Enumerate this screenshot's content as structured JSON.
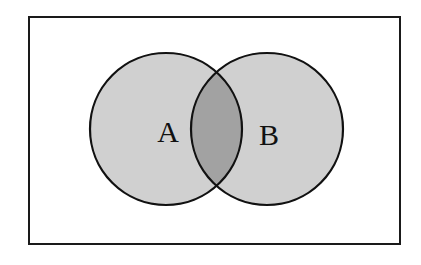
{
  "diagram": {
    "type": "venn",
    "universe": {
      "x": 29,
      "y": 17,
      "width": 371,
      "height": 227,
      "stroke": "#1a1a1a",
      "fill": "#ffffff"
    },
    "sets": [
      {
        "id": "A",
        "label": "A",
        "cx": 166,
        "cy": 129,
        "r": 76,
        "fill": "#d0d0d0",
        "stroke": "#111111",
        "label_x": 168,
        "label_y": 142
      },
      {
        "id": "B",
        "label": "B",
        "cx": 267,
        "cy": 129,
        "r": 76,
        "fill": "#d0d0d0",
        "stroke": "#111111",
        "label_x": 269,
        "label_y": 145
      }
    ],
    "intersection": {
      "sets": [
        "A",
        "B"
      ],
      "fill": "#a2a2a2",
      "shaded": true
    }
  }
}
